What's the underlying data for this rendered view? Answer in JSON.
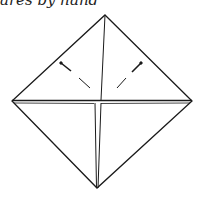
{
  "caption": "ares by hand",
  "diagram": {
    "type": "origami-fold-diagram",
    "outline_color": "#1a1a1a",
    "vertices": {
      "top": [
        105,
        15
      ],
      "left": [
        12,
        101
      ],
      "right": [
        192,
        101
      ],
      "bottom": [
        97,
        188
      ]
    },
    "fold_marks": [
      "left-dashed-valley-fold",
      "right-dashed-valley-fold"
    ]
  }
}
